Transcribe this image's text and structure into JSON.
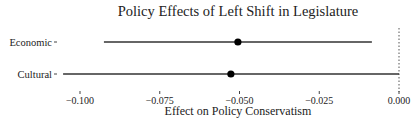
{
  "chart_data": {
    "type": "scatter",
    "subtype": "coefficient-plot",
    "title": "Policy Effects of Left Shift in Legislature",
    "xlabel": "Effect on Policy Conservatism",
    "ylabel": "",
    "xlim": [
      -0.106,
      0.0
    ],
    "x_ticks": [
      -0.1,
      -0.075,
      -0.05,
      -0.025,
      0.0
    ],
    "x_tick_labels": [
      "−0.100",
      "−0.075",
      "−0.050",
      "−0.025",
      "0.000"
    ],
    "categories": [
      "Economic",
      "Cultural"
    ],
    "series": [
      {
        "name": "Economic",
        "estimate": -0.0505,
        "ci_low": -0.0925,
        "ci_high": -0.0085
      },
      {
        "name": "Cultural",
        "estimate": -0.0527,
        "ci_low": -0.1053,
        "ci_high": 0.0
      }
    ],
    "reference_line": {
      "x": 0.0,
      "style": "dotted"
    },
    "grid": false,
    "legend": "none"
  }
}
